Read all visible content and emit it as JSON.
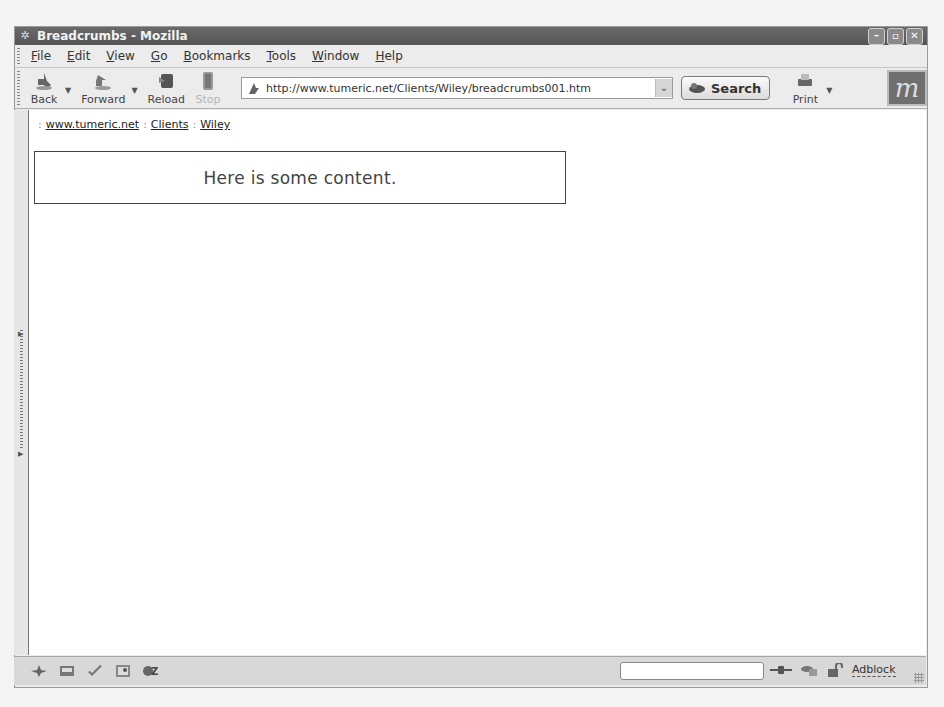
{
  "window": {
    "title": "Breadcrumbs - Mozilla",
    "controls": [
      "minimize",
      "maximize",
      "close"
    ]
  },
  "menubar": {
    "items": [
      {
        "label": "File",
        "accel": "F",
        "rest": "ile"
      },
      {
        "label": "Edit",
        "accel": "E",
        "rest": "dit"
      },
      {
        "label": "View",
        "accel": "V",
        "rest": "iew"
      },
      {
        "label": "Go",
        "accel": "G",
        "rest": "o"
      },
      {
        "label": "Bookmarks",
        "accel": "B",
        "rest": "ookmarks"
      },
      {
        "label": "Tools",
        "accel": "T",
        "rest": "ools"
      },
      {
        "label": "Window",
        "accel": "W",
        "rest": "indow"
      },
      {
        "label": "Help",
        "accel": "H",
        "rest": "elp"
      }
    ]
  },
  "toolbar": {
    "back_label": "Back",
    "forward_label": "Forward",
    "reload_label": "Reload",
    "stop_label": "Stop",
    "url": "http://www.tumeric.net/Clients/Wiley/breadcrumbs001.htm",
    "search_label": "Search",
    "print_label": "Print",
    "drop_glyph": "▼",
    "url_drop_glyph": "⌄",
    "logo_glyph": "m"
  },
  "page": {
    "breadcrumb_sep": ":",
    "breadcrumbs": [
      {
        "label": "www.tumeric.net"
      },
      {
        "label": "Clients"
      },
      {
        "label": "Wiley"
      }
    ],
    "content_text": "Here is some content."
  },
  "statusbar": {
    "icons": [
      "navigator-icon",
      "mail-icon",
      "composer-icon",
      "address-book-icon",
      "chatzilla-icon"
    ],
    "progress_text": "",
    "adblock_label": "Adblock"
  }
}
